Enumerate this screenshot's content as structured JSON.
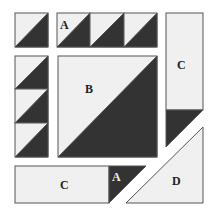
{
  "diagram": {
    "colors": {
      "light": "#f0f0f0",
      "dark": "#333333",
      "stroke": "#555555",
      "label_dark": "#222222",
      "label_light": "#f0f0f0"
    },
    "labels": {
      "top_a": "A",
      "center_b": "B",
      "right_c": "C",
      "bottom_c": "C",
      "bottom_a": "A",
      "corner_d": "D"
    }
  }
}
